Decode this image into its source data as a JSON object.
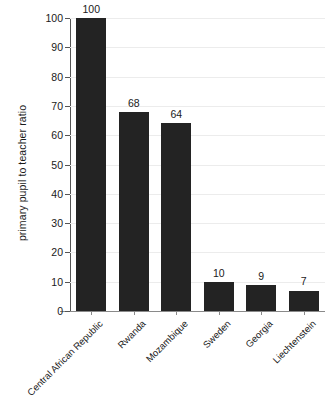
{
  "chart_data": {
    "type": "bar",
    "title": "",
    "subtitle": "",
    "xlabel": "",
    "ylabel": "primary pupil to teacher ratio",
    "categories": [
      "Central African Republic",
      "Rwanda",
      "Mozambique",
      "Sweden",
      "Georgia",
      "Liechtenstein"
    ],
    "values": [
      100,
      68,
      64,
      10,
      9,
      7
    ],
    "value_labels": [
      "100",
      "68",
      "64",
      "10",
      "9",
      "7"
    ],
    "ylim": [
      0,
      100
    ],
    "ytick_values": [
      0,
      10,
      20,
      30,
      40,
      50,
      60,
      70,
      80,
      90,
      100
    ],
    "ytick_labels": [
      "0",
      "10",
      "20",
      "30",
      "40",
      "50",
      "60",
      "70",
      "80",
      "90",
      "100"
    ],
    "grid": "horizontal",
    "legend": "none",
    "bar_color": "#232323",
    "gridline_color": "#ececec",
    "axis_color": "#555555",
    "background_color": "#ffffff",
    "xtick_label_rotation": -45
  }
}
